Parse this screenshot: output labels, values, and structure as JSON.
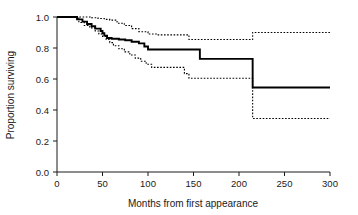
{
  "chart_data": {
    "type": "line",
    "title": "",
    "subtitle": "",
    "xlabel": "Months from first appearance",
    "ylabel": "Proportion surviving",
    "xlim": [
      0,
      300
    ],
    "ylim": [
      0.0,
      1.0
    ],
    "xticks": [
      0,
      50,
      100,
      150,
      200,
      250,
      300
    ],
    "xticklabels": [
      "0",
      "50",
      "100",
      "150",
      "200",
      "250",
      "300"
    ],
    "yticks": [
      0.0,
      0.2,
      0.4,
      0.6,
      0.8,
      1.0
    ],
    "yticklabels": [
      "0.0",
      "0.2",
      "0.4",
      "0.6",
      "0.8",
      "1.0"
    ],
    "grid": false,
    "legend": "none",
    "curve_style": "kaplan-meier-step",
    "series": [
      {
        "name": "Survival estimate",
        "style": "solid",
        "color": "#000000",
        "x": [
          0,
          18,
          22,
          28,
          33,
          38,
          42,
          45,
          48,
          50,
          52,
          55,
          60,
          68,
          75,
          82,
          90,
          96,
          100,
          104,
          108,
          157,
          215,
          300
        ],
        "y": [
          1.0,
          1.0,
          0.985,
          0.97,
          0.955,
          0.94,
          0.925,
          0.925,
          0.91,
          0.895,
          0.88,
          0.865,
          0.86,
          0.855,
          0.85,
          0.84,
          0.83,
          0.81,
          0.79,
          0.79,
          0.79,
          0.73,
          0.545,
          0.545
        ]
      },
      {
        "name": "Upper 95% confidence limit",
        "style": "dotted",
        "color": "#000000",
        "x": [
          0,
          22,
          30,
          38,
          45,
          52,
          58,
          66,
          74,
          82,
          90,
          100,
          110,
          140,
          145,
          215,
          300
        ],
        "y": [
          1.0,
          1.0,
          1.0,
          0.995,
          0.99,
          0.985,
          0.98,
          0.96,
          0.945,
          0.925,
          0.905,
          0.89,
          0.885,
          0.885,
          0.855,
          0.9,
          0.9
        ]
      },
      {
        "name": "Lower 95% confidence limit",
        "style": "dotted",
        "color": "#000000",
        "x": [
          0,
          18,
          24,
          30,
          36,
          42,
          46,
          50,
          54,
          58,
          62,
          68,
          74,
          80,
          86,
          92,
          98,
          104,
          140,
          145,
          215,
          300
        ],
        "y": [
          1.0,
          1.0,
          0.965,
          0.945,
          0.93,
          0.91,
          0.89,
          0.875,
          0.855,
          0.835,
          0.815,
          0.795,
          0.775,
          0.755,
          0.735,
          0.715,
          0.695,
          0.675,
          0.635,
          0.605,
          0.345,
          0.345
        ]
      }
    ]
  },
  "axes": {
    "x_title": "Months from first appearance",
    "y_title": "Proportion surviving"
  }
}
